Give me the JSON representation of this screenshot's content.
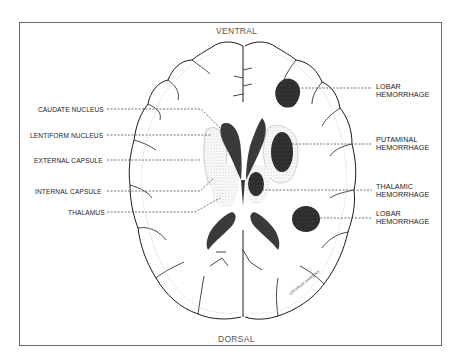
{
  "figure": {
    "orientation": {
      "top": "VENTRAL",
      "bottom": "DORSAL"
    },
    "left_labels": [
      "CAUDATE NUCLEUS",
      "LENTIFORM NUCLEUS",
      "EXTERNAL CAPSULE",
      "INTERNAL CAPSULE",
      "THALAMUS"
    ],
    "right_labels": [
      {
        "line1": "LOBAR",
        "line2": "HEMORRHAGE"
      },
      {
        "line1": "PUTAMINAL",
        "line2": "HEMORRHAGE"
      },
      {
        "line1": "THALAMIC",
        "line2": "HEMORRHAGE"
      },
      {
        "line1": "LOBAR",
        "line2": "HEMORRHAGE"
      }
    ],
    "signature": "GEORGE AHRENS",
    "colors": {
      "ink": "#1a1a1a",
      "hemorrhage": "#2e2e2e",
      "ventricle": "#3a3a3a",
      "stipple": "#b5b5b5",
      "frame": "#6a6a6a"
    }
  }
}
